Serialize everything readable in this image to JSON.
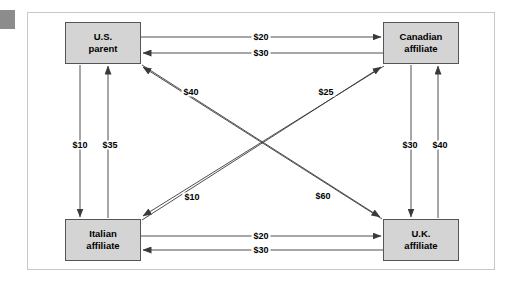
{
  "diagram": {
    "frame_color": "#c8c8c8",
    "node_fill": "#d4d4d4",
    "node_border": "#555555",
    "line_color": "#3a3a3a",
    "corner_mark_color": "#8c8c8c",
    "nodes": [
      {
        "id": "us",
        "line1": "U.S.",
        "line2": "parent"
      },
      {
        "id": "canada",
        "line1": "Canadian",
        "line2": "affiliate"
      },
      {
        "id": "italy",
        "line1": "Italian",
        "line2": "affiliate"
      },
      {
        "id": "uk",
        "line1": "U.K.",
        "line2": "affiliate"
      }
    ],
    "edges": [
      {
        "id": "us-canada",
        "from": "U.S. parent",
        "to": "Canadian affiliate",
        "amount": "$20"
      },
      {
        "id": "canada-us",
        "from": "Canadian affiliate",
        "to": "U.S. parent",
        "amount": "$30"
      },
      {
        "id": "us-italy",
        "from": "U.S. parent",
        "to": "Italian affiliate",
        "amount": "$10"
      },
      {
        "id": "italy-us",
        "from": "Italian affiliate",
        "to": "U.S. parent",
        "amount": "$35"
      },
      {
        "id": "canada-uk",
        "from": "Canadian affiliate",
        "to": "U.K. affiliate",
        "amount": "$30"
      },
      {
        "id": "uk-canada",
        "from": "U.K. affiliate",
        "to": "Canadian affiliate",
        "amount": "$40"
      },
      {
        "id": "italy-uk",
        "from": "Italian affiliate",
        "to": "U.K. affiliate",
        "amount": "$20"
      },
      {
        "id": "uk-italy",
        "from": "U.K. affiliate",
        "to": "Italian affiliate",
        "amount": "$30"
      },
      {
        "id": "canada-italy",
        "from": "Canadian affiliate",
        "to": "Italian affiliate",
        "amount": "$40"
      },
      {
        "id": "italy-canada",
        "from": "Italian affiliate",
        "to": "Canadian affiliate",
        "amount": "$10"
      },
      {
        "id": "uk-us",
        "from": "U.K. affiliate",
        "to": "U.S. parent",
        "amount": "$25"
      },
      {
        "id": "us-uk",
        "from": "U.S. parent",
        "to": "U.K. affiliate",
        "amount": "$60"
      }
    ]
  }
}
